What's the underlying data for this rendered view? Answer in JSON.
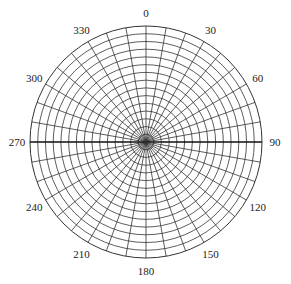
{
  "diagram": {
    "type": "polar-grid",
    "center": [
      146,
      142
    ],
    "radius": 116,
    "ring_count": 15,
    "radial_step_deg": 10,
    "line_color": "#333333",
    "axis_color": "#111111",
    "angle_labels": [
      {
        "text": "0",
        "deg": 0
      },
      {
        "text": "30",
        "deg": 30
      },
      {
        "text": "60",
        "deg": 60
      },
      {
        "text": "90",
        "deg": 90
      },
      {
        "text": "120",
        "deg": 120
      },
      {
        "text": "150",
        "deg": 150
      },
      {
        "text": "180",
        "deg": 180
      },
      {
        "text": "210",
        "deg": 210
      },
      {
        "text": "240",
        "deg": 240
      },
      {
        "text": "270",
        "deg": 270
      },
      {
        "text": "300",
        "deg": 300
      },
      {
        "text": "330",
        "deg": 330
      }
    ]
  }
}
